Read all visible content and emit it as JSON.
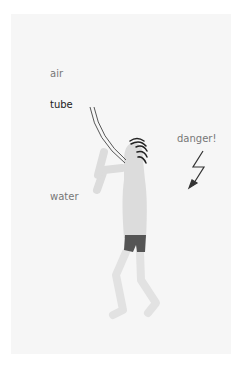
{
  "labels": {
    "air": "air",
    "tube": "tube",
    "danger": "danger!",
    "water": "water"
  },
  "colors": {
    "background": "#ffffff",
    "panel": "#f6f6f6",
    "body": "#dcdcdc",
    "shorts": "#555555",
    "hair": "#222222",
    "tube": "#333333",
    "arrow": "#333333",
    "label": "#777777",
    "label_emphasis": "#222222"
  }
}
